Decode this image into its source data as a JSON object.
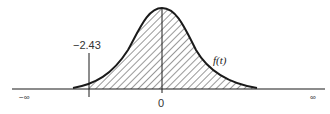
{
  "diagram": {
    "type": "probability-density-curve",
    "function_label": "f(t)",
    "tick_label": "−2.43",
    "tick_value": -2.43,
    "center_label": "0",
    "left_infinity": "−∞",
    "right_infinity": "∞",
    "shaded_region": "t > -2.43",
    "colors": {
      "line": "#1a1a1a",
      "hatch": "#333333",
      "background": "#ffffff"
    }
  }
}
